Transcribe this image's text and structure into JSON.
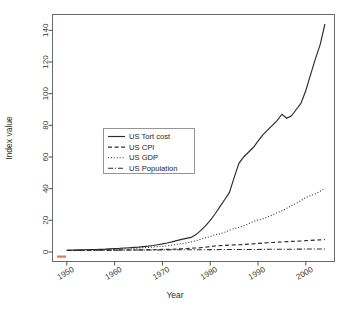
{
  "chart_data": {
    "type": "line",
    "title": "",
    "xlabel": "Year",
    "ylabel": "Index value",
    "xlim": [
      1947,
      2006
    ],
    "ylim": [
      -6,
      150
    ],
    "xticks": [
      1950,
      1960,
      1970,
      1980,
      1990,
      2000
    ],
    "yticks": [
      0,
      20,
      40,
      60,
      80,
      100,
      120,
      140
    ],
    "grid": false,
    "legend_position": "center-left",
    "x": [
      1950,
      1951,
      1952,
      1953,
      1954,
      1955,
      1956,
      1957,
      1958,
      1959,
      1960,
      1961,
      1962,
      1963,
      1964,
      1965,
      1966,
      1967,
      1968,
      1969,
      1970,
      1971,
      1972,
      1973,
      1974,
      1975,
      1976,
      1977,
      1978,
      1979,
      1980,
      1981,
      1982,
      1983,
      1984,
      1985,
      1986,
      1987,
      1988,
      1989,
      1990,
      1991,
      1992,
      1993,
      1994,
      1995,
      1996,
      1997,
      1998,
      1999,
      2000,
      2001,
      2002,
      2003,
      2004
    ],
    "series": [
      {
        "name": "US Tort cost",
        "style": "solid",
        "values": [
          1.0,
          1.1,
          1.2,
          1.3,
          1.4,
          1.5,
          1.6,
          1.7,
          1.8,
          2.0,
          2.2,
          2.3,
          2.5,
          2.7,
          2.9,
          3.1,
          3.4,
          3.7,
          4.1,
          4.6,
          5.1,
          5.7,
          6.4,
          7.2,
          8.0,
          8.6,
          9.2,
          11.0,
          13.5,
          16.5,
          20.0,
          24.0,
          28.5,
          33.0,
          37.5,
          47.0,
          56.0,
          60.0,
          63.0,
          66.0,
          70.0,
          74.0,
          77.0,
          80.0,
          83.0,
          87.0,
          84.5,
          86.0,
          90.0,
          94.0,
          102.0,
          112.0,
          122.0,
          131.0,
          144.0
        ]
      },
      {
        "name": "US CPI",
        "style": "dashed",
        "values": [
          1.0,
          1.05,
          1.08,
          1.09,
          1.1,
          1.1,
          1.12,
          1.16,
          1.19,
          1.2,
          1.22,
          1.24,
          1.25,
          1.27,
          1.29,
          1.31,
          1.35,
          1.39,
          1.45,
          1.53,
          1.62,
          1.69,
          1.74,
          1.85,
          2.05,
          2.24,
          2.37,
          2.52,
          2.72,
          3.03,
          3.43,
          3.79,
          4.02,
          4.15,
          4.33,
          4.48,
          4.57,
          4.73,
          4.93,
          5.17,
          5.45,
          5.68,
          5.85,
          6.02,
          6.18,
          6.35,
          6.54,
          6.69,
          6.8,
          6.95,
          7.18,
          7.38,
          7.5,
          7.67,
          7.88
        ]
      },
      {
        "name": "US GDP",
        "style": "dotted",
        "values": [
          1.0,
          1.15,
          1.22,
          1.29,
          1.3,
          1.42,
          1.5,
          1.58,
          1.6,
          1.73,
          1.8,
          1.86,
          2.0,
          2.11,
          2.27,
          2.47,
          2.71,
          2.87,
          3.14,
          3.4,
          3.59,
          3.91,
          4.31,
          4.83,
          5.24,
          5.71,
          6.37,
          7.09,
          8.02,
          8.97,
          9.77,
          10.93,
          11.44,
          12.45,
          13.8,
          14.77,
          15.58,
          16.56,
          17.87,
          19.21,
          20.33,
          21.02,
          22.18,
          23.34,
          24.77,
          26.05,
          27.59,
          29.33,
          30.72,
          32.48,
          34.46,
          35.62,
          36.78,
          38.35,
          40.5
        ]
      },
      {
        "name": "US Population",
        "style": "dashdot",
        "values": [
          1.0,
          1.02,
          1.03,
          1.05,
          1.07,
          1.09,
          1.1,
          1.12,
          1.14,
          1.16,
          1.18,
          1.2,
          1.21,
          1.23,
          1.25,
          1.26,
          1.28,
          1.29,
          1.31,
          1.32,
          1.34,
          1.36,
          1.37,
          1.38,
          1.4,
          1.41,
          1.43,
          1.44,
          1.46,
          1.47,
          1.49,
          1.5,
          1.52,
          1.53,
          1.55,
          1.56,
          1.58,
          1.59,
          1.61,
          1.62,
          1.64,
          1.66,
          1.68,
          1.7,
          1.72,
          1.74,
          1.76,
          1.78,
          1.8,
          1.82,
          1.84,
          1.86,
          1.88,
          1.9,
          1.92
        ]
      }
    ]
  },
  "legend": {
    "entries": [
      {
        "label": "US Tort cost"
      },
      {
        "label": "US CPI"
      },
      {
        "label": "US GDP"
      },
      {
        "label": "US Population"
      }
    ]
  },
  "axes": {
    "x_title": "Year",
    "y_title": "Index value",
    "x_tick_labels": [
      "1950",
      "1960",
      "1970",
      "1980",
      "1990",
      "2000"
    ],
    "y_tick_labels": [
      "0",
      "20",
      "40",
      "60",
      "80",
      "100",
      "120",
      "140"
    ]
  }
}
